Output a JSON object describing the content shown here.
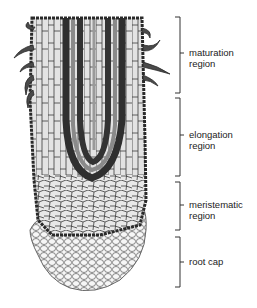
{
  "diagram": {
    "regions": [
      {
        "id": "maturation",
        "line1": "maturation",
        "line2": "region",
        "top": 17,
        "bottom": 93,
        "tick": 53
      },
      {
        "id": "elongation",
        "line1": "elongation",
        "line2": "region",
        "top": 98,
        "bottom": 176,
        "tick": 135
      },
      {
        "id": "meristematic",
        "line1": "meristematic",
        "line2": "region",
        "top": 182,
        "bottom": 230,
        "tick": 205
      },
      {
        "id": "root-cap",
        "line1": "root cap",
        "line2": "",
        "top": 237,
        "bottom": 287,
        "tick": 262
      }
    ],
    "colors": {
      "outline": "#2a2a2a",
      "vascular": "#3a3a3a",
      "cells_light": "#e6e6e6",
      "cells_mid": "#bdbdbd",
      "root_hair": "#4a4a4a",
      "cap_cells": "#f2f2f2"
    }
  }
}
